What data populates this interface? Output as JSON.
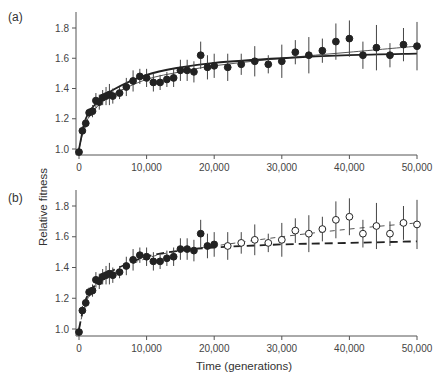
{
  "figure": {
    "panel_a_label": "(a)",
    "panel_b_label": "(b)",
    "ylabel": "Relative fitness",
    "xlabel": "Time (generations)"
  },
  "chart_data": [
    {
      "type": "scatter",
      "panel": "(a)",
      "title": "",
      "xlabel": "Time (generations)",
      "ylabel": "Relative fitness",
      "xlim": [
        0,
        50000
      ],
      "ylim": [
        0.98,
        1.88
      ],
      "xticks": [
        0,
        10000,
        20000,
        30000,
        40000,
        50000
      ],
      "xtick_labels": [
        "0",
        "10,000",
        "20,000",
        "30,000",
        "40,000",
        "50,000"
      ],
      "yticks": [
        1.0,
        1.2,
        1.4,
        1.6,
        1.8
      ],
      "ytick_labels": [
        "1.0",
        "1.2",
        "1.4",
        "1.6",
        "1.8"
      ],
      "grid": false,
      "series": [
        {
          "name": "Observed mean fitness",
          "marker": "filled-circle",
          "x": [
            0,
            500,
            1000,
            1500,
            2000,
            2500,
            3000,
            3500,
            4000,
            4500,
            5000,
            6000,
            7000,
            8000,
            9000,
            10000,
            11000,
            12000,
            13000,
            14000,
            15000,
            16000,
            17000,
            18000,
            19000,
            20000,
            22000,
            24000,
            26000,
            28000,
            30000,
            32000,
            34000,
            36000,
            38000,
            40000,
            42000,
            44000,
            46000,
            48000,
            50000
          ],
          "y": [
            0.98,
            1.12,
            1.17,
            1.24,
            1.25,
            1.32,
            1.31,
            1.34,
            1.35,
            1.36,
            1.35,
            1.37,
            1.41,
            1.45,
            1.48,
            1.47,
            1.44,
            1.44,
            1.46,
            1.47,
            1.52,
            1.52,
            1.51,
            1.62,
            1.54,
            1.55,
            1.54,
            1.56,
            1.58,
            1.56,
            1.58,
            1.64,
            1.62,
            1.65,
            1.71,
            1.73,
            1.62,
            1.67,
            1.62,
            1.69,
            1.68
          ],
          "err": [
            0.01,
            0.03,
            0.03,
            0.03,
            0.04,
            0.05,
            0.05,
            0.05,
            0.06,
            0.07,
            0.05,
            0.04,
            0.06,
            0.07,
            0.05,
            0.06,
            0.06,
            0.05,
            0.05,
            0.06,
            0.07,
            0.07,
            0.07,
            0.09,
            0.08,
            0.08,
            0.09,
            0.07,
            0.1,
            0.06,
            0.11,
            0.08,
            0.12,
            0.08,
            0.12,
            0.12,
            0.09,
            0.15,
            0.08,
            0.11,
            0.16
          ]
        },
        {
          "name": "Power-law fit",
          "style": "solid-thin",
          "x": [
            0,
            1000,
            2500,
            5000,
            10000,
            15000,
            20000,
            30000,
            40000,
            50000
          ],
          "y": [
            1.0,
            1.17,
            1.27,
            1.36,
            1.46,
            1.51,
            1.55,
            1.6,
            1.64,
            1.68
          ]
        },
        {
          "name": "Hyperbolic fit",
          "style": "solid-thick",
          "x": [
            0,
            1000,
            2500,
            5000,
            10000,
            15000,
            20000,
            30000,
            40000,
            50000
          ],
          "y": [
            1.0,
            1.2,
            1.3,
            1.39,
            1.49,
            1.54,
            1.57,
            1.6,
            1.62,
            1.63
          ]
        }
      ]
    },
    {
      "type": "scatter",
      "panel": "(b)",
      "title": "",
      "xlabel": "Time (generations)",
      "ylabel": "Relative fitness",
      "xlim": [
        0,
        50000
      ],
      "ylim": [
        0.98,
        1.88
      ],
      "xticks": [
        0,
        10000,
        20000,
        30000,
        40000,
        50000
      ],
      "xtick_labels": [
        "0",
        "10,000",
        "20,000",
        "30,000",
        "40,000",
        "50,000"
      ],
      "yticks": [
        1.0,
        1.2,
        1.4,
        1.6,
        1.8
      ],
      "ytick_labels": [
        "1.0",
        "1.2",
        "1.4",
        "1.6",
        "1.8"
      ],
      "grid": false,
      "series": [
        {
          "name": "Fitted data (0-20,000)",
          "marker": "filled-circle",
          "x": [
            0,
            500,
            1000,
            1500,
            2000,
            2500,
            3000,
            3500,
            4000,
            4500,
            5000,
            6000,
            7000,
            8000,
            9000,
            10000,
            11000,
            12000,
            13000,
            14000,
            15000,
            16000,
            17000,
            18000,
            19000,
            20000
          ],
          "y": [
            0.98,
            1.12,
            1.17,
            1.24,
            1.25,
            1.32,
            1.31,
            1.34,
            1.35,
            1.36,
            1.35,
            1.37,
            1.41,
            1.45,
            1.48,
            1.47,
            1.44,
            1.44,
            1.46,
            1.47,
            1.52,
            1.52,
            1.51,
            1.62,
            1.54,
            1.55
          ],
          "err": [
            0.01,
            0.03,
            0.03,
            0.03,
            0.04,
            0.05,
            0.05,
            0.05,
            0.06,
            0.07,
            0.05,
            0.04,
            0.06,
            0.07,
            0.05,
            0.06,
            0.06,
            0.05,
            0.05,
            0.06,
            0.07,
            0.07,
            0.07,
            0.09,
            0.08,
            0.08
          ]
        },
        {
          "name": "Predicted data (20,000-50,000)",
          "marker": "open-circle",
          "x": [
            22000,
            24000,
            26000,
            28000,
            30000,
            32000,
            34000,
            36000,
            38000,
            40000,
            42000,
            44000,
            46000,
            48000,
            50000
          ],
          "y": [
            1.54,
            1.56,
            1.58,
            1.56,
            1.58,
            1.64,
            1.62,
            1.65,
            1.71,
            1.73,
            1.62,
            1.67,
            1.62,
            1.69,
            1.68
          ],
          "err": [
            0.09,
            0.07,
            0.1,
            0.06,
            0.11,
            0.08,
            0.12,
            0.08,
            0.12,
            0.12,
            0.09,
            0.15,
            0.08,
            0.11,
            0.16
          ]
        },
        {
          "name": "Power-law fit (projected)",
          "style": "dashed-thin",
          "x": [
            0,
            1000,
            2500,
            5000,
            10000,
            15000,
            20000,
            30000,
            40000,
            50000
          ],
          "y": [
            1.0,
            1.17,
            1.27,
            1.36,
            1.46,
            1.51,
            1.54,
            1.6,
            1.65,
            1.69
          ]
        },
        {
          "name": "Hyperbolic fit (projected)",
          "style": "dashed-thick",
          "x": [
            0,
            1000,
            2500,
            5000,
            10000,
            15000,
            20000,
            30000,
            40000,
            50000
          ],
          "y": [
            1.0,
            1.19,
            1.29,
            1.38,
            1.47,
            1.51,
            1.53,
            1.55,
            1.56,
            1.57
          ]
        }
      ]
    }
  ]
}
